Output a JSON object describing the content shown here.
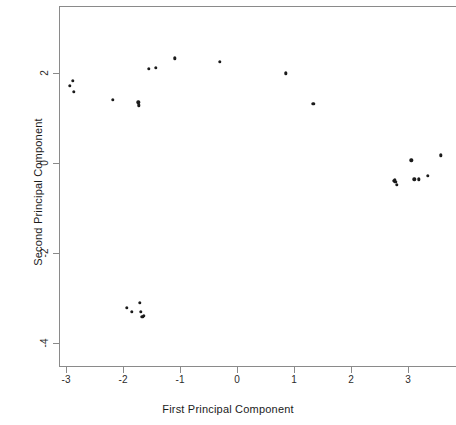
{
  "chart_data": {
    "type": "scatter",
    "title": "",
    "xlabel": "First Principal Component",
    "ylabel": "Second Principal Component",
    "xlim": [
      -3.5,
      3.85
    ],
    "ylim": [
      -4.9,
      2.9
    ],
    "xticks": [
      -3,
      -2,
      -1,
      0,
      1,
      2,
      3
    ],
    "xticklabels": [
      "-3",
      "-2",
      "-1",
      "0",
      "1",
      "2",
      "3"
    ],
    "yticks": [
      2,
      0,
      -2,
      -4
    ],
    "yticklabels": [
      "2",
      "0",
      "-2",
      "-4"
    ],
    "grid": false,
    "legend": null,
    "marker": "filled-circle",
    "marker_color": "#1b1b1b",
    "frame_color": "#8a8a8a",
    "background": "#ffffff",
    "series": [
      {
        "name": "observations",
        "points": [
          [
            -2.93,
            1.72
          ],
          [
            -2.88,
            1.82
          ],
          [
            -2.86,
            1.58
          ],
          [
            -2.18,
            1.4
          ],
          [
            -1.73,
            1.35
          ],
          [
            -1.72,
            1.28
          ],
          [
            -1.55,
            2.09
          ],
          [
            -1.42,
            2.12
          ],
          [
            -1.09,
            2.33
          ],
          [
            -0.3,
            2.25
          ],
          [
            0.86,
            1.99
          ],
          [
            1.34,
            1.32
          ],
          [
            -1.93,
            -3.22
          ],
          [
            -1.85,
            -3.3
          ],
          [
            -1.71,
            -3.1
          ],
          [
            -1.69,
            -3.3
          ],
          [
            -1.66,
            -3.42
          ],
          [
            -1.63,
            -3.39
          ],
          [
            2.75,
            -0.4
          ],
          [
            2.77,
            -0.38
          ],
          [
            2.78,
            -0.42
          ],
          [
            2.8,
            -0.48
          ],
          [
            3.06,
            0.06
          ],
          [
            3.11,
            -0.36
          ],
          [
            3.19,
            -0.36
          ],
          [
            3.35,
            -0.29
          ],
          [
            3.58,
            0.17
          ]
        ]
      }
    ]
  },
  "axes": {
    "x_title": "First Principal Component",
    "y_title": "Second Principal Component"
  }
}
